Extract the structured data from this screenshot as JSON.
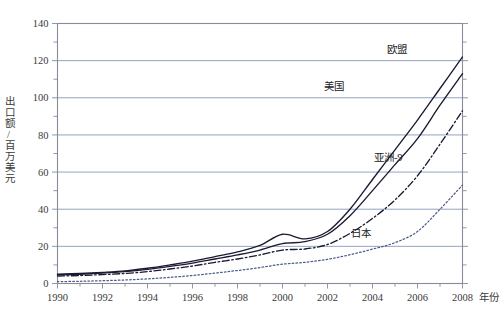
{
  "chart_data": {
    "type": "line",
    "title": "",
    "xlabel": "年份",
    "ylabel": "出口额/百万美元",
    "xlim": [
      1990,
      2008
    ],
    "ylim": [
      0,
      140
    ],
    "ytick_step": 20,
    "yminor_step": 10,
    "xtick_step": 1,
    "xlabel_step": 2,
    "grid": "horizontal",
    "legend_position": "inline-annotations",
    "x": [
      1990,
      1991,
      1992,
      1993,
      1994,
      1995,
      1996,
      1997,
      1998,
      1999,
      2000,
      2001,
      2002,
      2003,
      2004,
      2005,
      2006,
      2007,
      2008
    ],
    "ytick_labels": [
      "0",
      "20",
      "40",
      "60",
      "80",
      "100",
      "120",
      "140"
    ],
    "xtick_labels": [
      "1990",
      "1992",
      "1994",
      "1996",
      "1998",
      "2000",
      "2002",
      "2004",
      "2006",
      "2008"
    ],
    "xaxis_unit_suffix": "年份",
    "series": [
      {
        "name": "欧盟",
        "style": "solid",
        "color": "#1a1a33",
        "label_x": 2005.1,
        "label_y": 124.0,
        "values": [
          5.0,
          5.4,
          6.0,
          6.8,
          8.2,
          10.0,
          12.0,
          14.5,
          17.0,
          20.5,
          26.5,
          24.0,
          28.0,
          40.0,
          56.0,
          72.0,
          88.0,
          105.0,
          122.0
        ]
      },
      {
        "name": "美国",
        "style": "solid",
        "color": "#1a1a33",
        "label_x": 2002.3,
        "label_y": 104.0,
        "values": [
          4.6,
          5.0,
          5.6,
          6.4,
          7.6,
          9.2,
          11.0,
          13.2,
          15.4,
          18.0,
          21.5,
          22.5,
          26.5,
          36.5,
          50.0,
          64.0,
          78.0,
          96.0,
          113.0
        ]
      },
      {
        "name": "亚洲-9",
        "style": "dashdot",
        "color": "#1a1a33",
        "label_x": 2004.7,
        "label_y": 66.0,
        "values": [
          4.0,
          4.3,
          4.8,
          5.4,
          6.4,
          7.8,
          9.4,
          11.4,
          13.2,
          15.4,
          18.0,
          18.6,
          21.0,
          27.0,
          35.0,
          45.0,
          58.0,
          75.0,
          93.0
        ]
      },
      {
        "name": "日本",
        "style": "dotted",
        "color": "#4b5b8c",
        "label_x": 2003.5,
        "label_y": 25.0,
        "values": [
          1.0,
          1.2,
          1.5,
          1.9,
          2.5,
          3.3,
          4.3,
          5.6,
          7.0,
          8.6,
          10.4,
          11.4,
          13.0,
          15.5,
          18.5,
          22.0,
          28.0,
          40.0,
          53.0
        ]
      }
    ],
    "colors": {
      "grid": "#7a8ab0",
      "frame": "#8a8a9a",
      "axis_text": "#3a3a3a",
      "japan": "#4b5b8c",
      "dark_line": "#1a1a33"
    }
  }
}
